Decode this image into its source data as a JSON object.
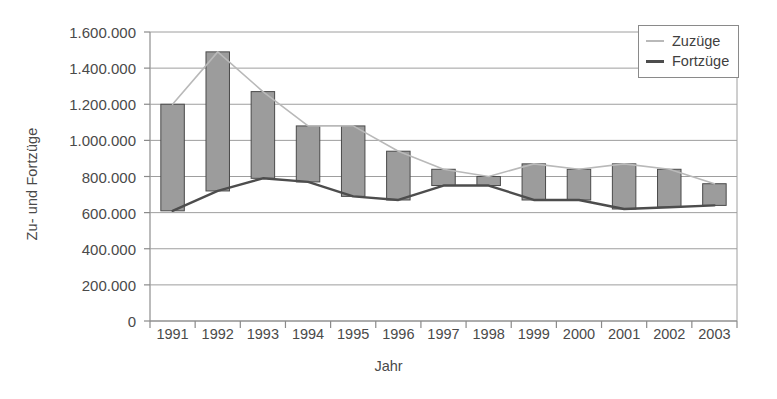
{
  "chart_data": {
    "type": "bar",
    "title": "",
    "subtitle": "",
    "xlabel": "Jahr",
    "ylabel": "Zu- und Fortzüge",
    "categories": [
      "1991",
      "1992",
      "1993",
      "1994",
      "1995",
      "1996",
      "1997",
      "1998",
      "1999",
      "2000",
      "2001",
      "2002",
      "2003"
    ],
    "series": [
      {
        "name": "Zuzüge",
        "color": "#b9b9b9",
        "values": [
          1200000,
          1490000,
          1270000,
          1080000,
          1080000,
          940000,
          840000,
          800000,
          870000,
          840000,
          870000,
          840000,
          760000
        ]
      },
      {
        "name": "Fortzüge",
        "color": "#4d4d4d",
        "values": [
          610000,
          720000,
          790000,
          770000,
          690000,
          670000,
          750000,
          750000,
          670000,
          670000,
          620000,
          630000,
          640000
        ]
      }
    ],
    "bars": {
      "description": "Floating bars spanning from Fortzüge to Zuzüge for each year",
      "fill": "#9c9c9c",
      "stroke": "#4a4a4a"
    },
    "ylim": [
      0,
      1600000
    ],
    "ytick_labels": [
      "1.600.000",
      "1.400.000",
      "1.200.000",
      "1.000.000",
      "800.000",
      "600.000",
      "400.000",
      "200.000",
      "0"
    ],
    "ytick_values": [
      1600000,
      1400000,
      1200000,
      1000000,
      800000,
      600000,
      400000,
      200000,
      0
    ],
    "grid": "horizontal",
    "legend_position": "top-right",
    "legend_entries": [
      "Zuzüge",
      "Fortzüge"
    ]
  },
  "legend": {
    "entries": [
      {
        "label": "Zuzüge"
      },
      {
        "label": "Fortzüge"
      }
    ]
  },
  "axes": {
    "y_title": "Zu- und Fortzüge",
    "x_title": "Jahr"
  }
}
